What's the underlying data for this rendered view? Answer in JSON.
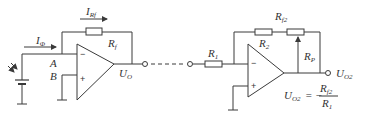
{
  "diagram": {
    "stage1": {
      "input_current_label": "I",
      "input_current_sub": "Φ",
      "feedback_current_label": "I",
      "feedback_current_sub": "Rf",
      "feedback_resistor_label": "R",
      "feedback_resistor_sub": "f",
      "node_a_label": "A",
      "node_b_label": "B",
      "output_label": "U",
      "output_sub": "O",
      "minus_sign": "−",
      "plus_sign": "+"
    },
    "stage2": {
      "r1_label": "R",
      "r1_sub": "1",
      "r2_label": "R",
      "r2_sub": "2",
      "rf2_label": "R",
      "rf2_sub": "f2",
      "rp_label": "R",
      "rp_sub": "P",
      "output_label": "U",
      "output_sub": "O2",
      "minus_sign": "−",
      "plus_sign": "+",
      "formula_lhs": "U",
      "formula_lhs_sub": "O2",
      "formula_eq": "= −",
      "formula_num": "R",
      "formula_num_sub": "f2",
      "formula_den": "R",
      "formula_den_sub": "1"
    }
  }
}
